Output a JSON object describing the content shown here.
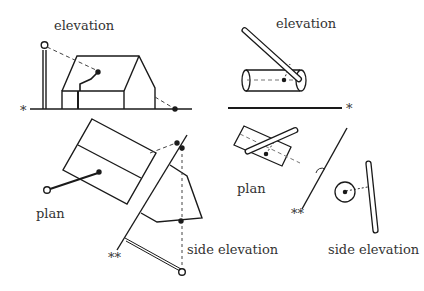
{
  "labels": {
    "left_elevation": "elevation",
    "left_plan": "plan",
    "left_side_elevation": "side elevation",
    "right_elevation": "elevation",
    "right_plan": "plan",
    "right_side_elevation": "side elevation"
  },
  "markers": {
    "single_star": "*",
    "double_star": "**"
  },
  "colors": {
    "ink": "#1a1a1a",
    "dashed": "#444444",
    "background": "#ffffff"
  }
}
